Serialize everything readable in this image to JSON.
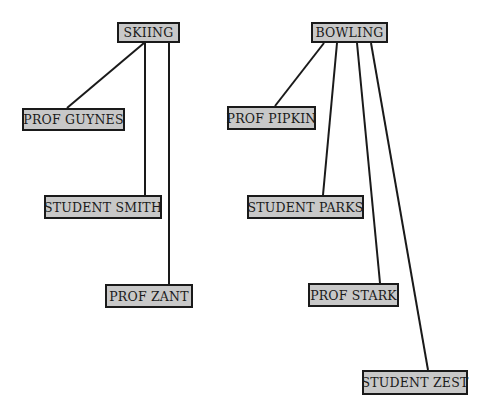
{
  "diagram": {
    "type": "tree",
    "groups": [
      {
        "root": {
          "label": "SKIING",
          "x": 117,
          "y": 22,
          "w": 63,
          "h": 21
        },
        "children": [
          {
            "label": "PROF GUYNES",
            "x": 22,
            "y": 108,
            "w": 103,
            "h": 23
          },
          {
            "label": "STUDENT SMITH",
            "x": 44,
            "y": 195,
            "w": 118,
            "h": 24
          },
          {
            "label": "PROF ZANT",
            "x": 105,
            "y": 284,
            "w": 88,
            "h": 24
          }
        ]
      },
      {
        "root": {
          "label": "BOWLING",
          "x": 311,
          "y": 22,
          "w": 77,
          "h": 21
        },
        "children": [
          {
            "label": "PROF PIPKIN",
            "x": 227,
            "y": 106,
            "w": 89,
            "h": 24
          },
          {
            "label": "STUDENT PARKS",
            "x": 247,
            "y": 195,
            "w": 117,
            "h": 24
          },
          {
            "label": "PROF STARK",
            "x": 308,
            "y": 283,
            "w": 91,
            "h": 24
          },
          {
            "label": "STUDENT ZEST",
            "x": 362,
            "y": 370,
            "w": 106,
            "h": 25
          }
        ]
      }
    ],
    "edges": [
      {
        "from": "SKIING",
        "to": "PROF GUYNES",
        "x1": 144,
        "y1": 43,
        "x2": 67,
        "y2": 108
      },
      {
        "from": "SKIING",
        "to": "STUDENT SMITH",
        "x1": 145,
        "y1": 43,
        "x2": 145,
        "y2": 195
      },
      {
        "from": "SKIING",
        "to": "PROF ZANT",
        "x1": 169,
        "y1": 43,
        "x2": 169,
        "y2": 284
      },
      {
        "from": "BOWLING",
        "to": "PROF PIPKIN",
        "x1": 324,
        "y1": 43,
        "x2": 275,
        "y2": 106
      },
      {
        "from": "BOWLING",
        "to": "STUDENT PARKS",
        "x1": 337,
        "y1": 43,
        "x2": 323,
        "y2": 195
      },
      {
        "from": "BOWLING",
        "to": "PROF STARK",
        "x1": 357,
        "y1": 43,
        "x2": 380,
        "y2": 283
      },
      {
        "from": "BOWLING",
        "to": "STUDENT ZEST",
        "x1": 371,
        "y1": 43,
        "x2": 428,
        "y2": 370
      }
    ],
    "colors": {
      "node_fill": "#c8c8c8",
      "stroke": "#1a1a1a",
      "background": "#ffffff"
    }
  }
}
